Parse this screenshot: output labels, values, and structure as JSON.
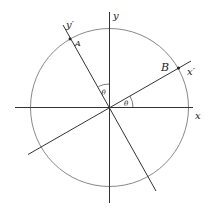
{
  "diagram": {
    "labels": {
      "x_axis": "x",
      "y_axis": "y",
      "x_prime_axis": "x′",
      "y_prime_axis": "y′",
      "point_a": "A",
      "point_b": "B",
      "angle_1": "θ",
      "angle_2": "θ"
    },
    "geometry": {
      "center": [
        109.5,
        107.5
      ],
      "circle_radius": 79,
      "rotation_angle_deg": 28
    },
    "colors": {
      "line": "#333333",
      "circle": "#666666",
      "text": "#222222"
    }
  }
}
